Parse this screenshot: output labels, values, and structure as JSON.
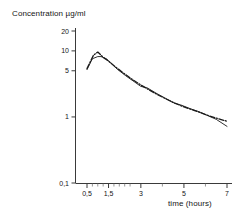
{
  "chart_data": {
    "type": "line",
    "title": "",
    "xlabel": "time (hours)",
    "ylabel": "Concentration µg/ml",
    "yscale": "log",
    "xscale": "linear",
    "xlim": [
      0.25,
      7.3
    ],
    "ylim": [
      0.1,
      25
    ],
    "grid": false,
    "legend": "none",
    "x_ticks": [
      {
        "value": 0.5,
        "label": "0,5"
      },
      {
        "value": 1.5,
        "label": "1,5"
      },
      {
        "value": 3,
        "label": "3"
      },
      {
        "value": 5,
        "label": "5"
      },
      {
        "value": 7,
        "label": "7"
      }
    ],
    "x_minor_ticks": [
      0.75,
      1.0,
      1.25,
      1.75,
      2.0,
      2.25,
      2.5,
      4.0,
      6.0
    ],
    "y_ticks": [
      {
        "value": 0.1,
        "label": "0,1"
      },
      {
        "value": 1,
        "label": "1"
      },
      {
        "value": 5,
        "label": "5"
      },
      {
        "value": 10,
        "label": "10"
      },
      {
        "value": 20,
        "label": "20"
      }
    ],
    "series": [
      {
        "name": "curve-solid",
        "style": "solid",
        "color": "#1a1a1a",
        "x": [
          0.5,
          0.75,
          1.0,
          1.15,
          1.4,
          1.6,
          1.9,
          2.3,
          2.7,
          3.0,
          3.3,
          3.7,
          4.1,
          4.5,
          4.9,
          5.3,
          5.7,
          6.1,
          6.5,
          7.0
        ],
        "y": [
          5.2,
          7.6,
          8.2,
          8.2,
          7.6,
          6.6,
          5.3,
          4.2,
          3.4,
          2.9,
          2.75,
          2.3,
          1.95,
          1.65,
          1.5,
          1.33,
          1.2,
          1.05,
          0.92,
          0.72
        ]
      },
      {
        "name": "curve-dashed",
        "style": "dash-dot",
        "color": "#1a1a1a",
        "x": [
          0.5,
          0.8,
          1.0,
          1.25,
          1.5,
          1.8,
          2.2,
          2.6,
          3.0,
          3.4,
          3.8,
          4.2,
          4.6,
          5.0,
          5.4,
          5.8,
          6.2,
          6.6,
          7.0
        ],
        "y": [
          5.4,
          8.6,
          9.6,
          8.0,
          7.0,
          5.8,
          4.6,
          3.7,
          3.05,
          2.55,
          2.15,
          1.85,
          1.6,
          1.42,
          1.28,
          1.15,
          1.03,
          0.94,
          0.86
        ]
      }
    ]
  },
  "axes": {
    "x_axis_name": "x-axis",
    "y_axis_name": "y-axis"
  }
}
